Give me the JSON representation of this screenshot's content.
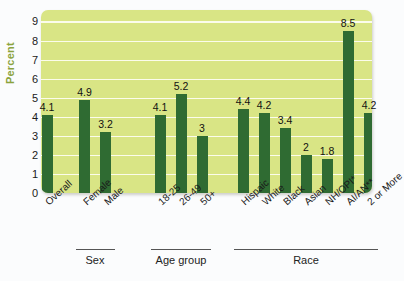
{
  "chart_data": {
    "type": "bar",
    "title": "",
    "xlabel": "",
    "ylabel": "Percent",
    "ylim": [
      0,
      9.6
    ],
    "yticks": [
      0,
      1,
      2,
      3,
      4,
      5,
      6,
      7,
      8,
      9
    ],
    "grid": true,
    "legend": "none",
    "categories": [
      "Overall",
      "Female",
      "Male",
      "18-25",
      "26-49",
      "50+",
      "Hispaic",
      "White",
      "Black",
      "Asian",
      "NH/OPI*",
      "AI/AN**",
      "2 or More"
    ],
    "values": [
      4.1,
      4.9,
      3.2,
      4.1,
      5.2,
      3,
      4.4,
      4.2,
      3.4,
      2,
      1.8,
      8.5,
      4.2
    ],
    "value_labels": [
      "4.1",
      "4.9",
      "3.2",
      "4.1",
      "5.2",
      "3",
      "4.4",
      "4.2",
      "3.4",
      "2",
      "1.8",
      "8.5",
      "4.2"
    ],
    "groups": [
      {
        "label": "Sex",
        "categories": [
          "Female",
          "Male"
        ]
      },
      {
        "label": "Age group",
        "categories": [
          "18-25",
          "26-49",
          "50+"
        ]
      },
      {
        "label": "Race",
        "categories": [
          "Hispaic",
          "White",
          "Black",
          "Asian",
          "NH/OPI*",
          "AI/AN**",
          "2 or More"
        ]
      }
    ],
    "colors": {
      "bar": "#2f6b32",
      "plot_background": "#d9e585",
      "gridline": "#fdfdf0",
      "axis_title": "#8aa33c",
      "page_background": "#fbfcfd",
      "text": "#1a1a1a"
    }
  }
}
